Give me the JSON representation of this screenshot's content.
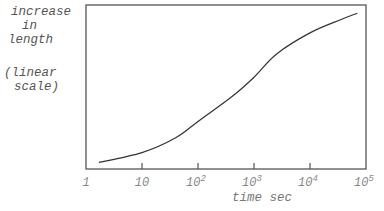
{
  "chart_data": {
    "type": "line",
    "title": "",
    "ylabel_lines": [
      "increase",
      "in",
      "length"
    ],
    "ylabel_note_lines": [
      "(linear",
      "scale)"
    ],
    "xlabel": "time sec",
    "xscale": "log",
    "xlim": [
      1,
      100000
    ],
    "x_ticks": [
      {
        "base": "1",
        "exp": ""
      },
      {
        "base": "10",
        "exp": ""
      },
      {
        "base": "10",
        "exp": "2"
      },
      {
        "base": "10",
        "exp": "3"
      },
      {
        "base": "10",
        "exp": "4"
      },
      {
        "base": "10",
        "exp": "5"
      }
    ],
    "yscale": "linear",
    "y_ticks": [],
    "grid": false,
    "legend": null,
    "series": [
      {
        "name": "increase in length",
        "x": [
          1.7,
          10,
          40,
          100,
          400,
          1000,
          2500,
          10000,
          35000,
          70000
        ],
        "y": [
          0.04,
          0.1,
          0.19,
          0.29,
          0.44,
          0.56,
          0.7,
          0.83,
          0.91,
          0.95
        ]
      }
    ]
  }
}
